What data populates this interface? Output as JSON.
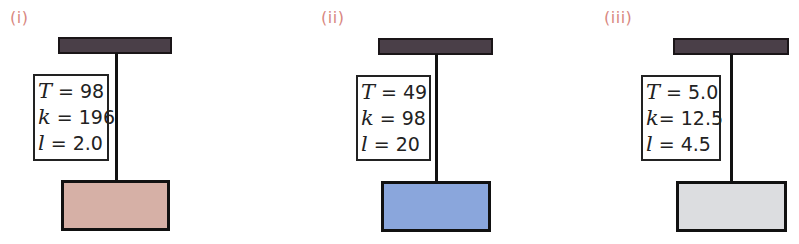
{
  "panels": [
    {
      "label": "(i)",
      "mass_color": "#d6b0a6",
      "params": [
        {
          "symbol": "T",
          "eq": " = ",
          "value": "98"
        },
        {
          "symbol": "k",
          "eq": " = ",
          "value": "196"
        },
        {
          "symbol": "l",
          "eq": " = ",
          "value": "2.0"
        }
      ]
    },
    {
      "label": "(ii)",
      "mass_color": "#8aa6dc",
      "params": [
        {
          "symbol": "T",
          "eq": " = ",
          "value": "49"
        },
        {
          "symbol": "k",
          "eq": " = ",
          "value": "98"
        },
        {
          "symbol": "l",
          "eq": " = ",
          "value": "20"
        }
      ]
    },
    {
      "label": "(iii)",
      "mass_color": "#dcdde0",
      "params": [
        {
          "symbol": "T",
          "eq": " = ",
          "value": "5.0"
        },
        {
          "symbol": "k",
          "eq": "= ",
          "value": "12.5"
        },
        {
          "symbol": "l",
          "eq": " = ",
          "value": "4.5"
        }
      ]
    }
  ]
}
